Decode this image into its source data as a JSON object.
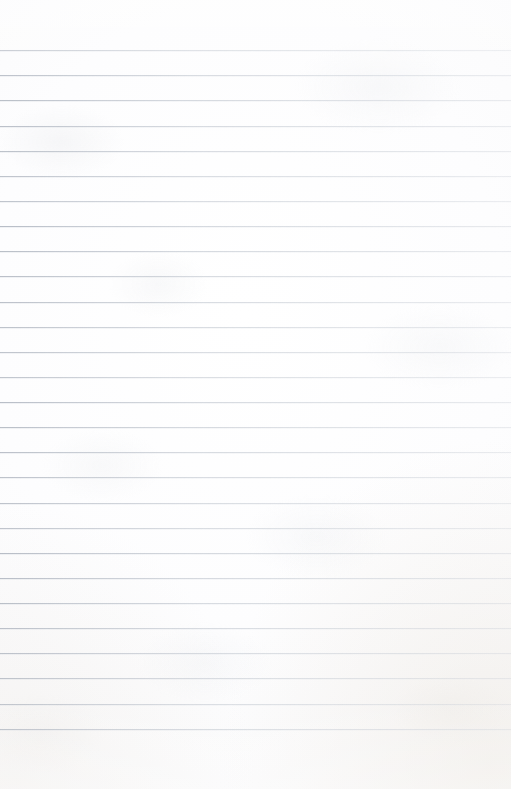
{
  "document": {
    "kind": "lined-notebook-page",
    "content_text": "",
    "width_px": 511,
    "height_px": 789
  },
  "paper": {
    "background_color": "#fbfbfc",
    "highlight_color": "#ffffff",
    "edge_tone_color": "#f2f2f3",
    "corner_warm_color": "#ece7e0"
  },
  "ruling": {
    "line_color": "#b0b6c0",
    "line_color_faded": "#ced2d9",
    "line_count": 28,
    "first_line_y": 50,
    "line_spacing_px": 25.1,
    "line_thickness_px": 1,
    "left_inset_px": 0,
    "right_inset_px": 0,
    "top_margin_px": 50,
    "bottom_margin_px": 48,
    "line_y_positions": [
      50,
      75,
      100,
      126,
      151,
      176,
      201,
      226,
      251,
      276,
      302,
      327,
      352,
      377,
      402,
      427,
      452,
      477,
      503,
      528,
      553,
      578,
      603,
      628,
      653,
      678,
      704,
      729
    ]
  }
}
